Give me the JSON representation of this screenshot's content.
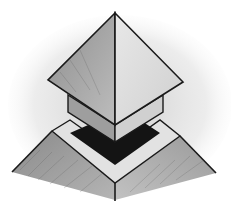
{
  "illustration": {
    "subject": "Hand-drawn pencil sketch of a pyramid-capped roof vent on a pitched roof",
    "colors": {
      "background": "#ffffff",
      "outline": "#1a1a1a",
      "light_face": "#e6e6e6",
      "mid_face": "#a8a8a8",
      "dark_face": "#6e6e6e",
      "opening": "#141414",
      "smudge": "#d2d2d2"
    }
  }
}
